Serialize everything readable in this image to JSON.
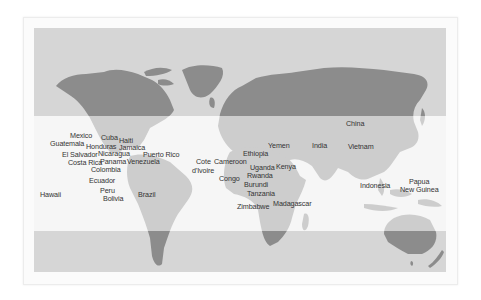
{
  "map": {
    "colors": {
      "band": "#d6d6d6",
      "light_band": "#f6f6f6",
      "land_dark": "#8c8c8c",
      "land_light": "#cdcdcd"
    },
    "labels": [
      {
        "id": "mexico",
        "text": "Mexico",
        "x": 70,
        "y": 132
      },
      {
        "id": "guatemala",
        "text": "Guatemala",
        "x": 50,
        "y": 140
      },
      {
        "id": "cuba",
        "text": "Cuba",
        "x": 101,
        "y": 134
      },
      {
        "id": "haiti",
        "text": "Haiti",
        "x": 119,
        "y": 137
      },
      {
        "id": "honduras",
        "text": "Honduras",
        "x": 86,
        "y": 143
      },
      {
        "id": "jamaica",
        "text": "Jamaica",
        "x": 119,
        "y": 144
      },
      {
        "id": "el-salvador",
        "text": "El Salvador",
        "x": 62,
        "y": 151
      },
      {
        "id": "nicaragua",
        "text": "Nicaragua",
        "x": 98,
        "y": 150
      },
      {
        "id": "puerto-rico",
        "text": "Puerto Rico",
        "x": 143,
        "y": 151
      },
      {
        "id": "costa-rica",
        "text": "Costa Rica",
        "x": 68,
        "y": 159
      },
      {
        "id": "panama",
        "text": "Panama",
        "x": 100,
        "y": 158
      },
      {
        "id": "venezuela",
        "text": "Venezuela",
        "x": 127,
        "y": 158
      },
      {
        "id": "colombia",
        "text": "Colombia",
        "x": 91,
        "y": 166
      },
      {
        "id": "ecuador",
        "text": "Ecuador",
        "x": 89,
        "y": 177
      },
      {
        "id": "peru",
        "text": "Peru",
        "x": 100,
        "y": 187
      },
      {
        "id": "hawaii",
        "text": "Hawaii",
        "x": 40,
        "y": 191
      },
      {
        "id": "brazil",
        "text": "Brazil",
        "x": 138,
        "y": 191
      },
      {
        "id": "bolivia",
        "text": "Bolivia",
        "x": 103,
        "y": 195
      },
      {
        "id": "cote-divoire",
        "text": "Cote",
        "x": 196,
        "y": 158
      },
      {
        "id": "cote-divoire-2",
        "text": "d'Ivoire",
        "x": 192,
        "y": 167
      },
      {
        "id": "cameroon",
        "text": "Cameroon",
        "x": 214,
        "y": 158
      },
      {
        "id": "congo",
        "text": "Congo",
        "x": 219,
        "y": 175
      },
      {
        "id": "ethiopia",
        "text": "Ethiopia",
        "x": 243,
        "y": 150
      },
      {
        "id": "yemen",
        "text": "Yemen",
        "x": 268,
        "y": 142
      },
      {
        "id": "india",
        "text": "India",
        "x": 312,
        "y": 142
      },
      {
        "id": "china",
        "text": "China",
        "x": 346,
        "y": 120
      },
      {
        "id": "vietnam",
        "text": "Vietnam",
        "x": 348,
        "y": 143
      },
      {
        "id": "uganda",
        "text": "Uganda",
        "x": 250,
        "y": 164
      },
      {
        "id": "kenya",
        "text": "Kenya",
        "x": 276,
        "y": 163
      },
      {
        "id": "rwanda",
        "text": "Rwanda",
        "x": 247,
        "y": 172
      },
      {
        "id": "burundi",
        "text": "Burundi",
        "x": 244,
        "y": 181
      },
      {
        "id": "tanzania",
        "text": "Tanzania",
        "x": 247,
        "y": 190
      },
      {
        "id": "zimbabwe",
        "text": "Zimbabwe",
        "x": 237,
        "y": 203
      },
      {
        "id": "madagascar",
        "text": "Madagascar",
        "x": 273,
        "y": 200
      },
      {
        "id": "indonesia",
        "text": "Indonesia",
        "x": 360,
        "y": 182
      },
      {
        "id": "papua",
        "text": "Papua",
        "x": 409,
        "y": 178
      },
      {
        "id": "new-guinea",
        "text": "New Guinea",
        "x": 400,
        "y": 186
      }
    ]
  }
}
